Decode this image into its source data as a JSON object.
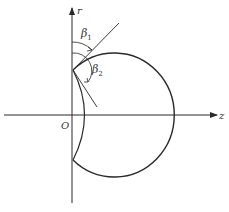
{
  "diagram": {
    "axes": {
      "vertical_label": "r",
      "horizontal_label": "z",
      "origin_label": "O"
    },
    "angles": [
      {
        "label": "β",
        "subscript": "1"
      },
      {
        "label": "β",
        "subscript": "2"
      }
    ],
    "colors": {
      "stroke": "#2a2a2a",
      "background": "#ffffff"
    }
  }
}
